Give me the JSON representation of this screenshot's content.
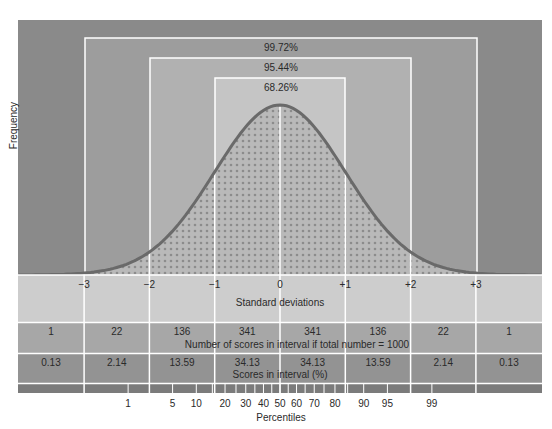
{
  "chart_data": {
    "type": "area",
    "title": "",
    "xlabel": "Standard deviations",
    "ylabel": "Frequency",
    "x_ticks": [
      "-3",
      "-2",
      "-1",
      "0",
      "+1",
      "+2",
      "+3"
    ],
    "curve": "normal distribution (mean 0, sd 1)",
    "intervals": [
      {
        "range": "-1 to +1",
        "label": "68.26%"
      },
      {
        "range": "-2 to +2",
        "label": "95.44%"
      },
      {
        "range": "-3 to +3",
        "label": "99.72%"
      }
    ],
    "counts_row": {
      "label": "Number of scores in interval if total number = 1000",
      "values": [
        1,
        22,
        136,
        341,
        341,
        136,
        22,
        1
      ]
    },
    "percent_row": {
      "label": "Scores in interval (%)",
      "values": [
        0.13,
        2.14,
        13.59,
        34.13,
        34.13,
        13.59,
        2.14,
        0.13
      ]
    },
    "percentiles": {
      "label": "Percentiles",
      "ticks": [
        1,
        5,
        10,
        20,
        30,
        40,
        50,
        60,
        70,
        80,
        90,
        95,
        99
      ]
    },
    "grid": false,
    "legend": "none"
  },
  "labels": {
    "ylabel": "Frequency",
    "pct_outer": "99.72%",
    "pct_middle": "95.44%",
    "pct_inner": "68.26%",
    "sd": [
      "−3",
      "−2",
      "−1",
      "0",
      "+1",
      "+2",
      "+3"
    ],
    "sd_title": "Standard deviations",
    "counts": [
      "1",
      "22",
      "136",
      "341",
      "341",
      "136",
      "22",
      "1"
    ],
    "counts_title": "Number of scores in interval if total number = 1000",
    "percents": [
      "0.13",
      "2.14",
      "13.59",
      "34.13",
      "34.13",
      "13.59",
      "2.14",
      "0.13"
    ],
    "percents_title": "Scores in interval (%)",
    "percentiles": [
      "1",
      "5",
      "10",
      "20",
      "30",
      "40",
      "50",
      "60",
      "70",
      "80",
      "90",
      "95",
      "99"
    ],
    "percentiles_title": "Percentiles"
  },
  "colors": {
    "outer_bg": "#8a8a8a",
    "box99": "#9c9c9c",
    "box95": "#b0b0b0",
    "box68": "#c4c4c4",
    "curve": "#6a6a6a",
    "sd_row": "#cdcdcd",
    "counts_row": "#a6a6a6",
    "percent_row": "#929292",
    "percentile_bar": "#7a7a7a",
    "divider": "#ffffff"
  }
}
